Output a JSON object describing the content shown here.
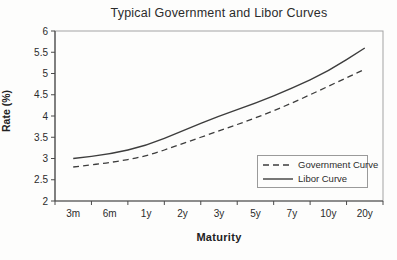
{
  "chart_data": {
    "type": "line",
    "title": "Typical Government and Libor Curves",
    "xlabel": "Maturity",
    "ylabel": "Rate (%)",
    "categories": [
      "3m",
      "6m",
      "1y",
      "2y",
      "3y",
      "5y",
      "7y",
      "10y",
      "20y"
    ],
    "series": [
      {
        "name": "Government Curve",
        "style": "dashed",
        "values": [
          2.8,
          2.9,
          3.05,
          3.35,
          3.65,
          3.95,
          4.3,
          4.7,
          5.1
        ]
      },
      {
        "name": "Libor Curve",
        "style": "solid",
        "values": [
          3.0,
          3.1,
          3.3,
          3.65,
          4.0,
          4.3,
          4.65,
          5.05,
          5.6
        ]
      }
    ],
    "ylim": [
      2,
      6
    ],
    "ytick_step": 0.5,
    "yticks": [
      "2",
      "2.5",
      "3",
      "3.5",
      "4",
      "4.5",
      "5",
      "5.5",
      "6"
    ],
    "legend_position": "bottom-right",
    "grid": false,
    "line_color": "#3d3d3d",
    "axis_color": "#4a4a4a",
    "plot_border_color": "#a3a3a3"
  }
}
